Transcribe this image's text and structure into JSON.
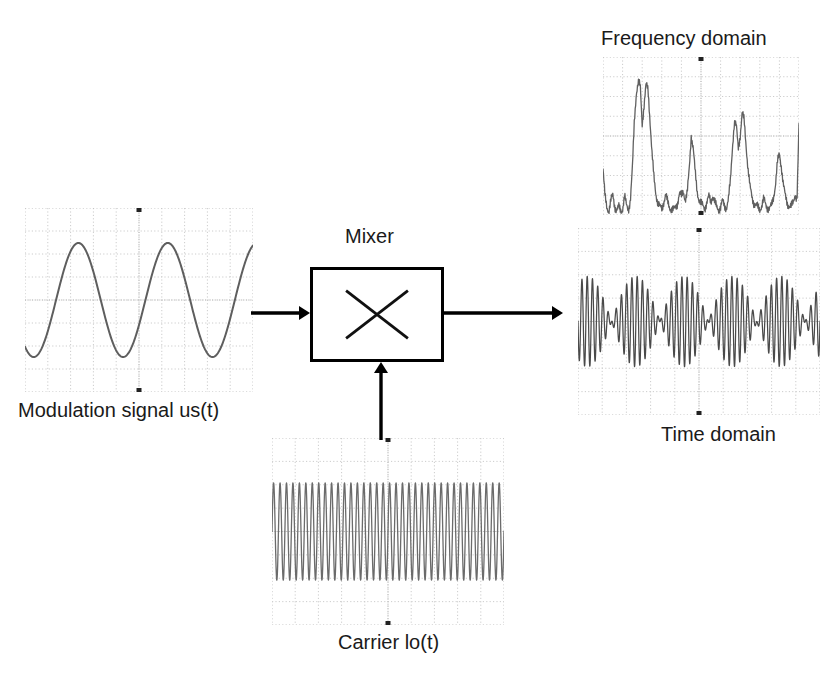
{
  "diagram": {
    "block": {
      "label": "Mixer",
      "symbol": "multiplier-x",
      "x": 310,
      "y": 267,
      "w": 134,
      "h": 95,
      "stroke": "#000000"
    },
    "arrows": [
      {
        "name": "modulation-to-mixer",
        "from": [
          251,
          313
        ],
        "to": [
          310,
          313
        ],
        "dir": "right"
      },
      {
        "name": "mixer-to-output",
        "from": [
          444,
          313
        ],
        "to": [
          563,
          313
        ],
        "dir": "right"
      },
      {
        "name": "carrier-to-mixer",
        "from": [
          381,
          440
        ],
        "to": [
          381,
          362
        ],
        "dir": "up"
      }
    ],
    "colors": {
      "ink": "#1a1a1a",
      "trace": "#555555",
      "grid": "#cccccc",
      "arrow": "#000000",
      "background": "#ffffff"
    }
  },
  "plots": {
    "modulation": {
      "caption": "Modulation signal us(t)",
      "caption_pos": [
        18,
        399
      ],
      "box": {
        "x": 25,
        "y": 208,
        "w": 228,
        "h": 184
      },
      "grid": {
        "cols": 10,
        "rows": 8,
        "style": "dotted"
      }
    },
    "carrier": {
      "caption": "Carrier lo(t)",
      "caption_pos": [
        338,
        631
      ],
      "box": {
        "x": 272,
        "y": 438,
        "w": 232,
        "h": 187
      },
      "grid": {
        "cols": 10,
        "rows": 8,
        "style": "dotted"
      }
    },
    "frequency": {
      "caption": "Frequency domain",
      "caption_pos": [
        601,
        27
      ],
      "box": {
        "x": 603,
        "y": 57,
        "w": 196,
        "h": 158
      },
      "grid": {
        "cols": 10,
        "rows": 8,
        "style": "dotted"
      }
    },
    "time": {
      "caption": "Time domain",
      "caption_pos": [
        661,
        423
      ],
      "box": {
        "x": 578,
        "y": 228,
        "w": 242,
        "h": 187
      },
      "grid": {
        "cols": 10,
        "rows": 8,
        "style": "dotted"
      }
    }
  },
  "chart_data": [
    {
      "type": "line",
      "name": "modulation-signal",
      "title": "Modulation signal us(t)",
      "xlabel": "time",
      "ylabel": "amplitude",
      "waveform": "sine",
      "cycles": 2.55,
      "amplitude": 0.62,
      "phase_deg": -125,
      "offset": 0.0,
      "ylim": [
        -1,
        1
      ],
      "grid": true,
      "samples": 400
    },
    {
      "type": "line",
      "name": "carrier-signal",
      "title": "Carrier lo(t)",
      "xlabel": "time",
      "ylabel": "amplitude",
      "waveform": "sine",
      "cycles": 36,
      "amplitude": 0.52,
      "phase_deg": 0,
      "offset": 0.0,
      "ylim": [
        -1,
        1
      ],
      "grid": true,
      "samples": 1600
    },
    {
      "type": "line",
      "name": "time-domain-output",
      "title": "Time domain",
      "xlabel": "time",
      "ylabel": "amplitude",
      "waveform": "amplitude-modulated",
      "carrier_cycles": 46,
      "modulation_cycles": 2.5,
      "modulation_depth": 0.62,
      "amplitude": 0.78,
      "phase_deg": -125,
      "ylim": [
        -1,
        1
      ],
      "grid": true,
      "samples": 2200
    },
    {
      "type": "line",
      "name": "frequency-domain-spectrum",
      "title": "Frequency domain",
      "xlabel": "frequency",
      "ylabel": "magnitude",
      "ylim": [
        0,
        1
      ],
      "grid": true,
      "x": [
        0.0,
        0.01,
        0.02,
        0.03,
        0.04,
        0.05,
        0.06,
        0.07,
        0.08,
        0.09,
        0.1,
        0.11,
        0.12,
        0.13,
        0.14,
        0.15,
        0.16,
        0.17,
        0.18,
        0.19,
        0.2,
        0.21,
        0.22,
        0.23,
        0.24,
        0.25,
        0.26,
        0.27,
        0.28,
        0.29,
        0.3,
        0.31,
        0.32,
        0.33,
        0.34,
        0.35,
        0.36,
        0.37,
        0.38,
        0.39,
        0.4,
        0.41,
        0.42,
        0.43,
        0.44,
        0.45,
        0.46,
        0.47,
        0.48,
        0.49,
        0.5,
        0.51,
        0.52,
        0.53,
        0.54,
        0.55,
        0.56,
        0.57,
        0.58,
        0.59,
        0.6,
        0.61,
        0.62,
        0.63,
        0.64,
        0.65,
        0.66,
        0.67,
        0.68,
        0.69,
        0.7,
        0.71,
        0.72,
        0.73,
        0.74,
        0.75,
        0.76,
        0.77,
        0.78,
        0.79,
        0.8,
        0.81,
        0.82,
        0.83,
        0.84,
        0.85,
        0.86,
        0.87,
        0.88,
        0.89,
        0.9,
        0.91,
        0.92,
        0.93,
        0.94,
        0.95,
        0.96,
        0.97,
        0.98,
        0.99,
        1.0
      ],
      "values": [
        0.3,
        0.12,
        0.05,
        0.03,
        0.09,
        0.13,
        0.06,
        0.03,
        0.05,
        0.03,
        0.04,
        0.12,
        0.06,
        0.04,
        0.1,
        0.3,
        0.62,
        0.8,
        0.86,
        0.84,
        0.6,
        0.72,
        0.85,
        0.82,
        0.62,
        0.4,
        0.24,
        0.14,
        0.08,
        0.05,
        0.04,
        0.09,
        0.13,
        0.08,
        0.05,
        0.04,
        0.03,
        0.05,
        0.08,
        0.14,
        0.12,
        0.16,
        0.1,
        0.14,
        0.3,
        0.52,
        0.44,
        0.28,
        0.16,
        0.1,
        0.07,
        0.06,
        0.05,
        0.08,
        0.12,
        0.09,
        0.13,
        0.08,
        0.05,
        0.04,
        0.05,
        0.09,
        0.06,
        0.05,
        0.1,
        0.22,
        0.44,
        0.6,
        0.58,
        0.44,
        0.52,
        0.66,
        0.62,
        0.46,
        0.3,
        0.18,
        0.12,
        0.08,
        0.06,
        0.05,
        0.04,
        0.06,
        0.1,
        0.07,
        0.05,
        0.04,
        0.06,
        0.12,
        0.2,
        0.34,
        0.4,
        0.32,
        0.2,
        0.12,
        0.08,
        0.06,
        0.05,
        0.08,
        0.14,
        0.1,
        0.58
      ]
    }
  ]
}
